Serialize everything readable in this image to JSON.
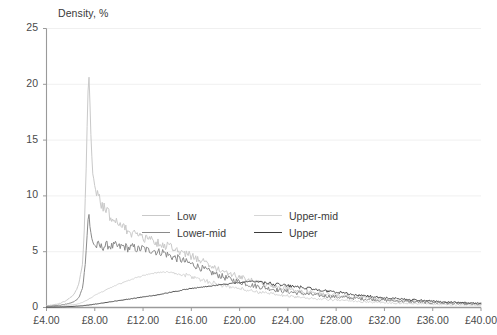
{
  "chart_data": {
    "type": "line",
    "title": "Density, %",
    "xlabel": "",
    "ylabel": "Density, %",
    "xlim": [
      4,
      40
    ],
    "ylim": [
      0,
      25
    ],
    "grid": true,
    "legend_position": "inside-center",
    "x_tick_labels": [
      "£4.00",
      "£8.00",
      "£12.00",
      "£16.00",
      "£20.00",
      "£24.00",
      "£28.00",
      "£32.00",
      "£36.00",
      "£40.00"
    ],
    "x_tick_values": [
      4,
      8,
      12,
      16,
      20,
      24,
      28,
      32,
      36,
      40
    ],
    "y_tick_labels": [
      "0",
      "5",
      "10",
      "15",
      "20",
      "25"
    ],
    "y_tick_values": [
      0,
      5,
      10,
      15,
      20,
      25
    ],
    "colors": {
      "low": "#c9c9c9",
      "lower_mid": "#8a8a8a",
      "upper_mid": "#d6d6d6",
      "upper": "#3c3c3c",
      "axis": "#9a9a9a",
      "grid": "#f0f0f0",
      "text": "#3a3a3a"
    },
    "series": [
      {
        "name": "Low",
        "color": "#c9c9c9",
        "peak_x": 7.5,
        "peak_y": 21.3,
        "x": [
          4.0,
          4.3,
          4.6,
          4.9,
          5.2,
          5.5,
          5.8,
          6.1,
          6.4,
          6.7,
          7.0,
          7.15,
          7.3,
          7.4,
          7.5,
          7.6,
          7.7,
          7.85,
          8.0,
          8.2,
          8.4,
          8.6,
          8.8,
          9.0,
          9.2,
          9.4,
          9.6,
          9.8,
          10.0,
          10.3,
          10.6,
          10.9,
          11.2,
          11.5,
          11.8,
          12.1,
          12.4,
          12.7,
          13.0,
          13.4,
          13.8,
          14.2,
          14.6,
          15.0,
          15.4,
          15.8,
          16.2,
          16.6,
          17.0,
          17.5,
          18.0,
          18.5,
          19.0,
          19.5,
          20.0,
          20.5,
          21.0,
          21.5,
          22.0,
          22.5,
          23.0,
          23.5,
          24.0,
          24.5,
          25.0,
          25.5,
          26.0,
          27.0,
          28.0,
          29.0,
          30.0,
          31.0,
          32.0,
          33.0,
          34.0,
          35.0,
          36.0,
          37.0,
          38.0,
          39.0,
          40.0
        ],
        "y": [
          0.15,
          0.2,
          0.25,
          0.3,
          0.4,
          0.55,
          0.75,
          1.0,
          1.4,
          2.2,
          4.0,
          7.5,
          13.0,
          18.0,
          21.3,
          18.5,
          14.5,
          11.8,
          10.9,
          10.2,
          9.6,
          9.2,
          8.9,
          8.6,
          8.3,
          8.1,
          7.9,
          7.7,
          7.5,
          7.2,
          7.0,
          6.8,
          6.6,
          6.5,
          6.35,
          6.2,
          6.1,
          6.0,
          5.9,
          5.75,
          5.6,
          5.45,
          5.3,
          5.1,
          4.9,
          4.7,
          4.5,
          4.3,
          4.1,
          3.85,
          3.6,
          3.35,
          3.1,
          2.9,
          2.7,
          2.55,
          2.4,
          2.25,
          2.1,
          2.0,
          1.9,
          1.8,
          1.7,
          1.6,
          1.5,
          1.42,
          1.35,
          1.2,
          1.1,
          1.0,
          0.9,
          0.82,
          0.74,
          0.68,
          0.6,
          0.54,
          0.48,
          0.42,
          0.38,
          0.33,
          0.3
        ]
      },
      {
        "name": "Lower-mid",
        "color": "#8a8a8a",
        "peak_x": 7.5,
        "peak_y": 8.7,
        "x": [
          4.0,
          4.3,
          4.6,
          4.9,
          5.2,
          5.5,
          5.8,
          6.1,
          6.4,
          6.7,
          7.0,
          7.2,
          7.35,
          7.45,
          7.5,
          7.6,
          7.75,
          7.9,
          8.1,
          8.3,
          8.5,
          8.8,
          9.1,
          9.4,
          9.7,
          10.0,
          10.4,
          10.8,
          11.2,
          11.6,
          12.0,
          12.4,
          12.8,
          13.2,
          13.6,
          14.0,
          14.5,
          15.0,
          15.5,
          16.0,
          16.5,
          17.0,
          17.5,
          18.0,
          18.5,
          19.0,
          19.5,
          20.0,
          20.5,
          21.0,
          21.5,
          22.0,
          22.5,
          23.0,
          23.5,
          24.0,
          24.5,
          25.0,
          26.0,
          27.0,
          28.0,
          29.0,
          30.0,
          31.0,
          32.0,
          33.0,
          34.0,
          35.0,
          36.0,
          37.0,
          38.0,
          39.0,
          40.0
        ],
        "y": [
          0.1,
          0.12,
          0.15,
          0.18,
          0.22,
          0.28,
          0.35,
          0.45,
          0.6,
          0.9,
          1.8,
          3.8,
          6.2,
          8.0,
          8.7,
          7.2,
          6.2,
          5.7,
          5.45,
          5.6,
          5.4,
          5.5,
          5.6,
          5.45,
          5.55,
          5.4,
          5.5,
          5.3,
          5.4,
          5.2,
          5.3,
          5.1,
          5.2,
          4.95,
          5.0,
          4.75,
          4.5,
          4.35,
          4.1,
          3.9,
          3.7,
          3.45,
          3.2,
          3.0,
          2.8,
          2.6,
          2.45,
          2.3,
          2.15,
          2.0,
          1.9,
          1.8,
          1.7,
          1.6,
          1.5,
          1.42,
          1.35,
          1.28,
          1.15,
          1.05,
          0.95,
          0.87,
          0.79,
          0.72,
          0.65,
          0.59,
          0.53,
          0.48,
          0.43,
          0.39,
          0.35,
          0.31,
          0.28
        ]
      },
      {
        "name": "Upper-mid",
        "color": "#d6d6d6",
        "peak_x": 14.0,
        "peak_y": 3.2,
        "x": [
          4.0,
          4.5,
          5.0,
          5.5,
          6.0,
          6.5,
          7.0,
          7.4,
          7.8,
          8.2,
          8.6,
          9.0,
          9.5,
          10.0,
          10.5,
          11.0,
          11.5,
          12.0,
          12.5,
          13.0,
          13.5,
          14.0,
          14.5,
          15.0,
          15.5,
          16.0,
          16.5,
          17.0,
          17.5,
          18.0,
          18.5,
          19.0,
          19.5,
          20.0,
          20.5,
          21.0,
          21.5,
          22.0,
          22.5,
          23.0,
          23.5,
          24.0,
          25.0,
          26.0,
          27.0,
          28.0,
          29.0,
          30.0,
          31.0,
          32.0,
          33.0,
          34.0,
          35.0,
          36.0,
          37.0,
          38.0,
          39.0,
          40.0
        ],
        "y": [
          0.08,
          0.1,
          0.13,
          0.17,
          0.22,
          0.3,
          0.45,
          0.7,
          0.95,
          1.2,
          1.4,
          1.6,
          1.85,
          2.1,
          2.3,
          2.5,
          2.7,
          2.85,
          3.0,
          3.1,
          3.15,
          3.2,
          3.1,
          3.0,
          2.9,
          2.75,
          2.6,
          2.45,
          2.3,
          2.15,
          2.0,
          1.9,
          1.8,
          1.7,
          1.6,
          1.5,
          1.4,
          1.32,
          1.24,
          1.16,
          1.1,
          1.04,
          0.92,
          0.82,
          0.74,
          0.66,
          0.6,
          0.54,
          0.49,
          0.44,
          0.4,
          0.36,
          0.33,
          0.3,
          0.27,
          0.24,
          0.22,
          0.2
        ]
      },
      {
        "name": "Upper",
        "color": "#3c3c3c",
        "peak_x": 21.0,
        "peak_y": 2.35,
        "x": [
          4.0,
          4.5,
          5.0,
          5.5,
          6.0,
          6.5,
          7.0,
          7.5,
          8.0,
          8.5,
          9.0,
          9.5,
          10.0,
          10.5,
          11.0,
          11.5,
          12.0,
          12.5,
          13.0,
          13.5,
          14.0,
          14.5,
          15.0,
          15.5,
          16.0,
          16.5,
          17.0,
          17.5,
          18.0,
          18.5,
          19.0,
          19.5,
          20.0,
          20.5,
          21.0,
          21.5,
          22.0,
          22.5,
          23.0,
          23.5,
          24.0,
          24.5,
          25.0,
          25.5,
          26.0,
          26.5,
          27.0,
          27.5,
          28.0,
          28.5,
          29.0,
          30.0,
          31.0,
          32.0,
          33.0,
          34.0,
          35.0,
          36.0,
          37.0,
          38.0,
          39.0,
          40.0
        ],
        "y": [
          0.03,
          0.04,
          0.05,
          0.07,
          0.09,
          0.12,
          0.16,
          0.22,
          0.3,
          0.38,
          0.46,
          0.54,
          0.62,
          0.7,
          0.78,
          0.86,
          0.95,
          1.02,
          1.1,
          1.2,
          1.3,
          1.42,
          1.5,
          1.62,
          1.7,
          1.78,
          1.85,
          1.92,
          1.98,
          2.05,
          2.1,
          2.18,
          2.22,
          2.28,
          2.35,
          2.28,
          2.22,
          2.15,
          2.08,
          2.02,
          1.95,
          1.88,
          1.82,
          1.75,
          1.68,
          1.6,
          1.52,
          1.45,
          1.38,
          1.3,
          1.22,
          1.1,
          0.98,
          0.88,
          0.8,
          0.72,
          0.65,
          0.58,
          0.52,
          0.46,
          0.4,
          0.36
        ]
      }
    ]
  },
  "legend": {
    "items": [
      {
        "label": "Low",
        "color": "#c9c9c9"
      },
      {
        "label": "Upper-mid",
        "color": "#d6d6d6"
      },
      {
        "label": "Lower-mid",
        "color": "#8a8a8a"
      },
      {
        "label": "Upper",
        "color": "#3c3c3c"
      }
    ]
  }
}
